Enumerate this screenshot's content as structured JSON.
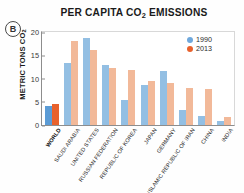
{
  "panel": {
    "badge": "B"
  },
  "legend": {
    "position": "top-right",
    "items": [
      {
        "label": "1990",
        "color": "#6fa8dc",
        "icon": "legend-dot-1990"
      },
      {
        "label": "2013",
        "color": "#e8612c",
        "icon": "legend-dot-2013"
      }
    ]
  },
  "colors": {
    "series_1990": "#93bfe3",
    "series_2013": "#f2b999",
    "series_1990_highlight": "#5b9bd5",
    "series_2013_highlight": "#e8612c",
    "axis": "#8d8d8d",
    "frame": "#d8d8d8"
  },
  "chart_data": {
    "type": "bar",
    "title": "PER CAPITA CO2 EMISSIONS",
    "title_main": "PER CAPITA CO",
    "title_sub": "2",
    "title_tail": " EMISSIONS",
    "xlabel": "",
    "ylabel": "METRIC TONS CO2",
    "ylabel_main": "METRIC TONS CO",
    "ylabel_sub": "2",
    "ylim": [
      0,
      20
    ],
    "yticks": [
      0,
      5,
      10,
      15,
      20
    ],
    "ytick_labels": [
      "0",
      "5",
      "10",
      "15",
      "20"
    ],
    "grid": false,
    "legend_position": "top-right",
    "categories": [
      "WORLD",
      "SAUDI ARABIA",
      "UNITED STATES",
      "RUSSIAN FEDERATION",
      "REPUBLIC OF KOREA",
      "JAPAN",
      "GERMANY",
      "ISLAMIC REPUBLIC OF IRAN",
      "CHINA",
      "INDIA"
    ],
    "highlight_category": "WORLD",
    "series": [
      {
        "name": "1990",
        "values": [
          4.0,
          13.3,
          18.5,
          12.8,
          5.4,
          8.6,
          11.4,
          3.2,
          1.9,
          0.8
        ]
      },
      {
        "name": "2013",
        "values": [
          4.5,
          17.8,
          16.0,
          12.1,
          11.6,
          9.4,
          8.9,
          7.8,
          7.6,
          1.7
        ]
      }
    ]
  }
}
